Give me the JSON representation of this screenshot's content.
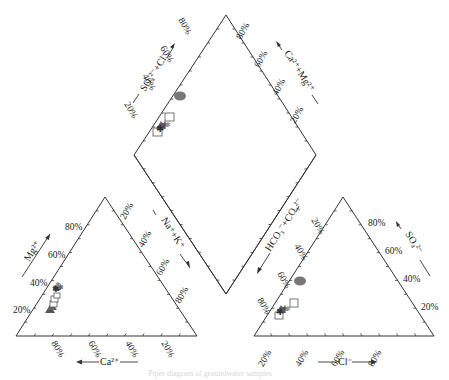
{
  "chart_data": {
    "type": "scatter",
    "subtype": "piper-trilinear",
    "title": "",
    "caption": "Piper diagram of groundwater samples",
    "grid": false,
    "legend": null,
    "colors": {
      "frame": "#333333",
      "ellipse": "#777777",
      "square": "#ffffff",
      "triangle": "#555555",
      "star": "#444444"
    },
    "cation_triangle": {
      "axes": {
        "left": {
          "label": "Mg²⁺",
          "ticks": [
            "20%",
            "40%",
            "60%",
            "80%"
          ]
        },
        "right": {
          "label": "Na⁺+K⁺",
          "ticks": [
            "20%",
            "40%",
            "60%",
            "80%"
          ]
        },
        "bottom": {
          "label": "Ca²⁺",
          "ticks": [
            "80%",
            "60%",
            "40%",
            "20%"
          ]
        }
      },
      "points": [
        {
          "marker": "triangle",
          "Ca": 78,
          "Mg": 20,
          "NaK": 2
        },
        {
          "marker": "triangle",
          "Ca": 76,
          "Mg": 22,
          "NaK": 2
        },
        {
          "marker": "square",
          "Ca": 74,
          "Mg": 24,
          "NaK": 2
        },
        {
          "marker": "square",
          "Ca": 73,
          "Mg": 27,
          "NaK": 0
        },
        {
          "marker": "square",
          "Ca": 71,
          "Mg": 26,
          "NaK": 3
        },
        {
          "marker": "star",
          "Ca": 70,
          "Mg": 28,
          "NaK": 2
        },
        {
          "marker": "star",
          "Ca": 69,
          "Mg": 29,
          "NaK": 2
        },
        {
          "marker": "star",
          "Ca": 67,
          "Mg": 30,
          "NaK": 3
        },
        {
          "marker": "ellipse",
          "Ca": 68,
          "Mg": 29,
          "NaK": 3
        }
      ]
    },
    "anion_triangle": {
      "axes": {
        "left": {
          "label": "HCO₃⁻+CO₃²⁻",
          "ticks": [
            "20%",
            "40%",
            "60%",
            "80%"
          ]
        },
        "right": {
          "label": "SO₄²⁻",
          "ticks": [
            "20%",
            "40%",
            "60%",
            "80%"
          ]
        },
        "bottom": {
          "label": "Cl⁻",
          "ticks": [
            "20%",
            "40%",
            "60%",
            "80%"
          ]
        }
      },
      "points": [
        {
          "marker": "ellipse",
          "HCO3": 58,
          "SO4": 38,
          "Cl": 4
        },
        {
          "marker": "square",
          "HCO3": 77,
          "SO4": 16,
          "Cl": 7
        },
        {
          "marker": "square",
          "HCO3": 86,
          "SO4": 10,
          "Cl": 4
        },
        {
          "marker": "star",
          "HCO3": 84,
          "SO4": 13,
          "Cl": 3
        },
        {
          "marker": "star",
          "HCO3": 82,
          "SO4": 14,
          "Cl": 4
        },
        {
          "marker": "star",
          "HCO3": 83,
          "SO4": 12,
          "Cl": 5
        },
        {
          "marker": "triangle",
          "HCO3": 84,
          "SO4": 14,
          "Cl": 2
        }
      ]
    },
    "diamond": {
      "axes": {
        "upper_left": {
          "label": "SO₄²⁻+Cl⁻",
          "ticks": [
            "20%",
            "40%",
            "60%",
            "80%"
          ]
        },
        "upper_right": {
          "label": "Ca²⁺+Mg²⁺",
          "ticks": [
            "20%",
            "40%",
            "60%",
            "80%"
          ]
        }
      },
      "points": [
        {
          "marker": "ellipse",
          "SO4Cl": 42,
          "CaMg": 97
        },
        {
          "marker": "square",
          "SO4Cl": 23,
          "CaMg": 98
        },
        {
          "marker": "square",
          "SO4Cl": 14,
          "CaMg": 99
        },
        {
          "marker": "star",
          "SO4Cl": 17,
          "CaMg": 98
        },
        {
          "marker": "star",
          "SO4Cl": 18,
          "CaMg": 97
        },
        {
          "marker": "star",
          "SO4Cl": 16,
          "CaMg": 98
        },
        {
          "marker": "triangle",
          "SO4Cl": 16,
          "CaMg": 98
        }
      ]
    }
  },
  "labels": {
    "mg": "Mg²⁺",
    "nak": "Na⁺+K⁺",
    "ca": "Ca²⁺",
    "hco3": "HCO₃⁻+CO₃²⁻",
    "so4": "SO₄²⁻",
    "cl": "Cl⁻",
    "so4cl": "SO₄²⁻+Cl⁻",
    "camg": "Ca²⁺+Mg²⁺",
    "p20": "20%",
    "p40": "40%",
    "p60": "60%",
    "p80": "80%",
    "caption": "Piper diagram of groundwater samples"
  }
}
